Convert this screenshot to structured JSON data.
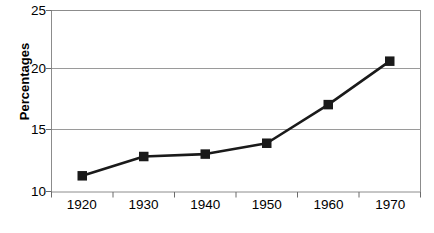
{
  "chart_data": {
    "type": "line",
    "title": "",
    "xlabel": "",
    "ylabel": "Percentages",
    "categories": [
      "1920",
      "1930",
      "1940",
      "1950",
      "1960",
      "1970"
    ],
    "values": [
      11.3,
      12.9,
      13.1,
      14.0,
      17.2,
      20.8
    ],
    "series": [
      {
        "name": "Percentages",
        "values": [
          11.3,
          12.9,
          13.1,
          14.0,
          17.2,
          20.8
        ]
      }
    ],
    "ylim": [
      10,
      25
    ],
    "yticks": [
      "10",
      "15",
      "20",
      "25"
    ],
    "ytick_values": [
      10,
      15,
      20,
      25
    ],
    "xticks": [
      "1920",
      "1930",
      "1940",
      "1950",
      "1960",
      "1970"
    ],
    "grid": "horizontal",
    "legend": "none",
    "marker": "filled-square",
    "line_color": "#1a1a1a",
    "marker_color": "#1a1a1a",
    "grid_color": "#999999",
    "axis_color": "#6b6b6b",
    "background": "#ffffff"
  },
  "axes": {
    "y_title": "Percentages",
    "y_tick_labels": [
      "25",
      "20",
      "15",
      "10"
    ],
    "x_tick_labels": [
      "1920",
      "1930",
      "1940",
      "1950",
      "1960",
      "1970"
    ]
  }
}
